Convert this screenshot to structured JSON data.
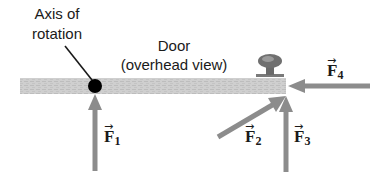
{
  "diagram": {
    "labels": {
      "axis_line1": "Axis of",
      "axis_line2": "rotation",
      "door_line1": "Door",
      "door_line2": "(overhead view)"
    },
    "forces": [
      {
        "id": "F1",
        "symbol": "F",
        "subscript": "1",
        "direction": "up",
        "applied_at": "axis of rotation"
      },
      {
        "id": "F2",
        "symbol": "F",
        "subscript": "2",
        "direction": "up-right (angled)",
        "applied_at": "door edge"
      },
      {
        "id": "F3",
        "symbol": "F",
        "subscript": "3",
        "direction": "up",
        "applied_at": "door edge"
      },
      {
        "id": "F4",
        "symbol": "F",
        "subscript": "4",
        "direction": "left",
        "applied_at": "door edge"
      }
    ],
    "vector_arrow": "→",
    "colors": {
      "door": "#c8c8c8",
      "arrow": "#8c8c8c",
      "pivot": "#000000",
      "knob": "#6e6e6e",
      "text": "#1a1a1a"
    }
  }
}
